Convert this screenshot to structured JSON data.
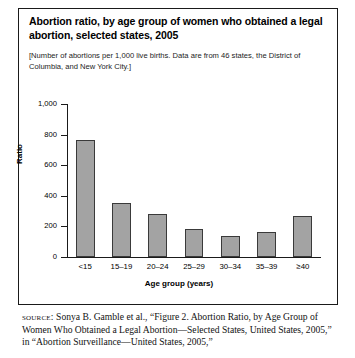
{
  "figure": {
    "title": "Abortion ratio, by age group of women who obtained a legal abortion, selected states, 2005",
    "subtitle": "[Number of abortions per 1,000 live births. Data are from 46 states, the District of Columbia, and New York City.]",
    "source_label": "source:",
    "source_text": "Sonya B. Gamble et al., “Figure 2. Abortion Ratio, by Age Group of Women Who Obtained a Legal Abortion—Selected States, United States, 2005,” in “Abortion Surveillance—United States, 2005,”"
  },
  "chart_data": {
    "type": "bar",
    "title": "Abortion ratio, by age group of women who obtained a legal abortion, selected states, 2005",
    "xlabel": "Age group (years)",
    "ylabel": "Ratio",
    "categories": [
      "<15",
      "15–19",
      "20–24",
      "25–29",
      "30–34",
      "35–39",
      "≥40"
    ],
    "values": [
      765,
      355,
      281,
      185,
      135,
      165,
      271
    ],
    "ylim": [
      0,
      1000
    ],
    "yticks": [
      0,
      200,
      400,
      600,
      800,
      1000
    ],
    "ytick_labels": [
      "0",
      "200",
      "400",
      "600",
      "800",
      "1,000"
    ],
    "grid": false,
    "legend": false,
    "bar_color": "#a3a3a3",
    "bar_edge_color": "#3a3a3a"
  }
}
